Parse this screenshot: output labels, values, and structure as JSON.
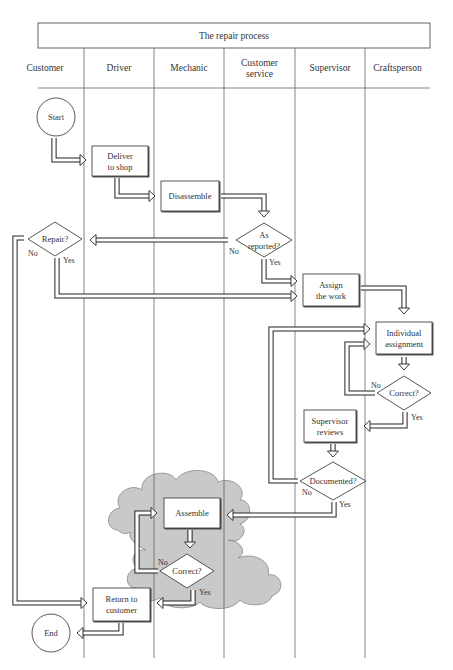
{
  "diagram": {
    "title": "The repair process",
    "lanes": [
      {
        "id": "customer",
        "label": [
          "Customer"
        ],
        "x0": 38,
        "x1": 84
      },
      {
        "id": "driver",
        "label": [
          "Driver"
        ],
        "x0": 84,
        "x1": 154
      },
      {
        "id": "mechanic",
        "label": [
          "Mechanic"
        ],
        "x0": 154,
        "x1": 224
      },
      {
        "id": "customer-service",
        "label": [
          "Customer",
          "service"
        ],
        "x0": 224,
        "x1": 295
      },
      {
        "id": "supervisor",
        "label": [
          "Supervisor"
        ],
        "x0": 295,
        "x1": 365
      },
      {
        "id": "craftsperson",
        "label": [
          "Craftsperson"
        ],
        "x0": 365,
        "x1": 430
      }
    ],
    "nodes": [
      {
        "id": "start",
        "type": "terminal",
        "lane": "customer",
        "label": [
          "Start"
        ],
        "cx": 56,
        "cy": 117,
        "r": 19
      },
      {
        "id": "deliver",
        "type": "process",
        "lane": "driver",
        "label": [
          "Deliver",
          "to shop"
        ],
        "x": 92,
        "y": 146,
        "w": 56,
        "h": 30
      },
      {
        "id": "disassemble",
        "type": "process",
        "lane": "mechanic",
        "label": [
          "Disassemble"
        ],
        "x": 161,
        "y": 181,
        "w": 58,
        "h": 30
      },
      {
        "id": "as-reported",
        "type": "decision",
        "lane": "customer-service",
        "label": [
          "As",
          "reported?"
        ],
        "cx": 264,
        "cy": 240,
        "hw": 28,
        "hh": 17
      },
      {
        "id": "repair",
        "type": "decision",
        "lane": "customer",
        "label": [
          "Repair?"
        ],
        "cx": 55,
        "cy": 239,
        "hw": 27,
        "hh": 17
      },
      {
        "id": "assign-work",
        "type": "process",
        "lane": "supervisor",
        "label": [
          "Assign",
          "the work"
        ],
        "x": 303,
        "y": 274,
        "w": 56,
        "h": 32
      },
      {
        "id": "individual-assignment",
        "type": "process",
        "lane": "craftsperson",
        "label": [
          "Individual",
          "assignment"
        ],
        "x": 376,
        "y": 322,
        "w": 56,
        "h": 32
      },
      {
        "id": "correct-craft",
        "type": "decision",
        "lane": "craftsperson",
        "label": [
          "Correct?"
        ],
        "cx": 404,
        "cy": 393,
        "hw": 27,
        "hh": 17
      },
      {
        "id": "supervisor-reviews",
        "type": "process",
        "lane": "supervisor",
        "label": [
          "Supervisor",
          "reviews"
        ],
        "x": 304,
        "y": 410,
        "w": 52,
        "h": 32
      },
      {
        "id": "documented",
        "type": "decision",
        "lane": "supervisor",
        "label": [
          "Documented?"
        ],
        "cx": 333,
        "cy": 481,
        "hw": 33,
        "hh": 19
      },
      {
        "id": "assemble",
        "type": "process",
        "lane": "mechanic",
        "label": [
          "Assemble"
        ],
        "x": 164,
        "y": 498,
        "w": 56,
        "h": 30
      },
      {
        "id": "correct-mech",
        "type": "decision",
        "lane": "mechanic",
        "label": [
          "Correct?"
        ],
        "cx": 187,
        "cy": 571,
        "hw": 27,
        "hh": 17
      },
      {
        "id": "return",
        "type": "process",
        "lane": "driver",
        "label": [
          "Return to",
          "customer"
        ],
        "x": 93,
        "y": 588,
        "w": 57,
        "h": 33
      },
      {
        "id": "end",
        "type": "terminal",
        "lane": "customer",
        "label": [
          "End"
        ],
        "cx": 51,
        "cy": 633,
        "r": 19
      }
    ],
    "branch_labels": [
      {
        "text": "No",
        "x": 28,
        "y": 256
      },
      {
        "text": "Yes",
        "x": 63,
        "y": 263
      },
      {
        "text": "No",
        "x": 229,
        "y": 254
      },
      {
        "text": "Yes",
        "x": 269,
        "y": 265
      },
      {
        "text": "No",
        "x": 371,
        "y": 388
      },
      {
        "text": "Yes",
        "x": 411,
        "y": 420
      },
      {
        "text": "No",
        "x": 302,
        "y": 495
      },
      {
        "text": "Yes",
        "x": 339,
        "y": 507
      },
      {
        "text": "No",
        "x": 158,
        "y": 565
      },
      {
        "text": "Yes",
        "x": 199,
        "y": 595
      }
    ],
    "connections": [
      {
        "from": "start",
        "to": "deliver",
        "points": [
          [
            54,
            138
          ],
          [
            54,
            160
          ],
          [
            86,
            160
          ]
        ]
      },
      {
        "from": "deliver",
        "to": "disassemble",
        "points": [
          [
            117,
            178
          ],
          [
            117,
            196
          ],
          [
            155,
            196
          ]
        ]
      },
      {
        "from": "disassemble",
        "to": "as-reported",
        "points": [
          [
            221,
            196
          ],
          [
            264,
            196
          ],
          [
            264,
            217
          ]
        ]
      },
      {
        "from": "as-reported",
        "to": "repair",
        "label": "No",
        "points": [
          [
            228,
            240
          ],
          [
            90,
            240
          ]
        ]
      },
      {
        "from": "as-reported",
        "to": "assign-work",
        "label": "Yes",
        "points": [
          [
            264,
            259
          ],
          [
            264,
            281
          ],
          [
            297,
            281
          ]
        ]
      },
      {
        "from": "repair",
        "to": "assign-work",
        "label": "Yes",
        "points": [
          [
            57,
            258
          ],
          [
            57,
            296
          ],
          [
            297,
            296
          ]
        ]
      },
      {
        "from": "repair",
        "to": "return",
        "label": "No",
        "points": [
          [
            24,
            238
          ],
          [
            15,
            238
          ],
          [
            15,
            603
          ],
          [
            87,
            603
          ]
        ]
      },
      {
        "from": "assign-work",
        "to": "individual-assignment",
        "points": [
          [
            361,
            288
          ],
          [
            404,
            288
          ],
          [
            404,
            314
          ]
        ]
      },
      {
        "from": "documented",
        "to": "individual-assignment",
        "label": "No",
        "points": [
          [
            298,
            481
          ],
          [
            271,
            481
          ],
          [
            271,
            329
          ],
          [
            370,
            329
          ]
        ]
      },
      {
        "from": "individual-assignment",
        "to": "correct-craft",
        "points": [
          [
            404,
            357
          ],
          [
            404,
            370
          ]
        ]
      },
      {
        "from": "correct-craft",
        "to": "individual-assignment",
        "label": "No",
        "points": [
          [
            375,
            393
          ],
          [
            347,
            393
          ],
          [
            347,
            344
          ],
          [
            370,
            344
          ]
        ]
      },
      {
        "from": "correct-craft",
        "to": "supervisor-reviews",
        "label": "Yes",
        "points": [
          [
            405,
            412
          ],
          [
            405,
            426
          ],
          [
            364,
            426
          ]
        ]
      },
      {
        "from": "supervisor-reviews",
        "to": "documented",
        "points": [
          [
            333,
            444
          ],
          [
            333,
            457
          ]
        ]
      },
      {
        "from": "documented",
        "to": "assemble",
        "label": "Yes",
        "points": [
          [
            334,
            502
          ],
          [
            334,
            515
          ],
          [
            227,
            515
          ]
        ]
      },
      {
        "from": "assemble",
        "to": "correct-mech",
        "points": [
          [
            190,
            530
          ],
          [
            190,
            548
          ]
        ]
      },
      {
        "from": "correct-mech",
        "to": "assemble",
        "label": "No",
        "points": [
          [
            158,
            571
          ],
          [
            137,
            571
          ],
          [
            137,
            513
          ],
          [
            157,
            513
          ]
        ]
      },
      {
        "from": "correct-mech",
        "to": "return",
        "label": "Yes",
        "points": [
          [
            193,
            590
          ],
          [
            193,
            603
          ],
          [
            157,
            603
          ]
        ]
      },
      {
        "from": "return",
        "to": "end",
        "points": [
          [
            121,
            623
          ],
          [
            121,
            633
          ],
          [
            77,
            633
          ]
        ]
      }
    ],
    "highlight_region": {
      "label": "cloud",
      "color": "#c9c9c9"
    }
  }
}
